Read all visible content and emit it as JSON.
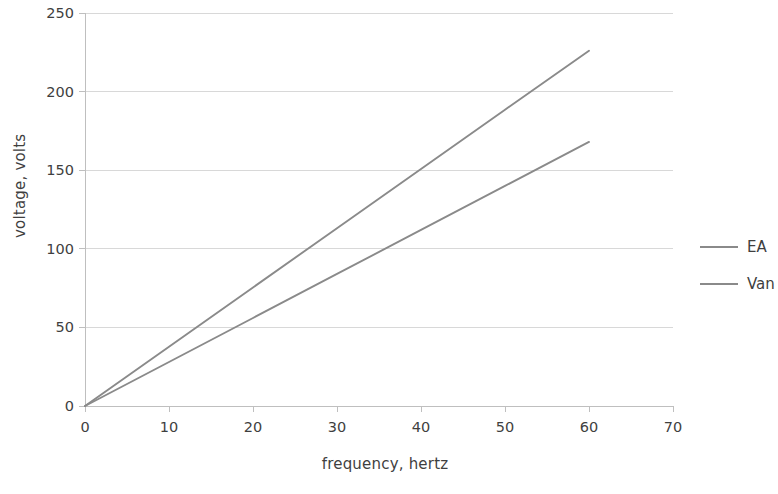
{
  "chart_data": {
    "type": "line",
    "title": "",
    "xlabel": "frequency, hertz",
    "ylabel": "voltage, volts",
    "xlim": [
      0,
      70
    ],
    "ylim": [
      0,
      250
    ],
    "xticks": [
      0,
      10,
      20,
      30,
      40,
      50,
      60,
      70
    ],
    "yticks": [
      0,
      50,
      100,
      150,
      200,
      250
    ],
    "xtick_labels": [
      "0",
      "10",
      "20",
      "30",
      "40",
      "50",
      "60",
      "70"
    ],
    "ytick_labels": [
      "0",
      "50",
      "100",
      "150",
      "200",
      "250"
    ],
    "grid": "horizontal",
    "legend_position": "right",
    "series": [
      {
        "name": "EA",
        "color": "#8a8a8a",
        "x": [
          0,
          10,
          20,
          30,
          40,
          50,
          60
        ],
        "values": [
          0,
          37.7,
          75.4,
          113.1,
          150.8,
          188.5,
          226.0
        ]
      },
      {
        "name": "Van",
        "color": "#8a8a8a",
        "x": [
          0,
          10,
          20,
          30,
          40,
          50,
          60
        ],
        "values": [
          0,
          28.0,
          56.0,
          84.0,
          112.0,
          140.0,
          168.0
        ]
      }
    ]
  },
  "legend": {
    "items": [
      {
        "label": "EA"
      },
      {
        "label": "Van"
      }
    ]
  },
  "axes": {
    "x_title": "frequency, hertz",
    "y_title": "voltage, volts"
  },
  "colors": {
    "series_line": "#8a8a8a",
    "gridline": "#d8d8d8",
    "axis": "#bfbfbf",
    "text": "#3f3f3f",
    "background": "#ffffff"
  }
}
